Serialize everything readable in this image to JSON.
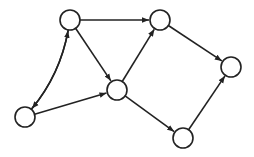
{
  "diagram": {
    "type": "directed-graph",
    "stroke_color": "#222222",
    "node_fill": "#ffffff",
    "node_radius": 10,
    "nodes": [
      {
        "id": "A",
        "x": 70,
        "y": 20
      },
      {
        "id": "B",
        "x": 25,
        "y": 117
      },
      {
        "id": "C",
        "x": 117,
        "y": 90
      },
      {
        "id": "D",
        "x": 160,
        "y": 20
      },
      {
        "id": "E",
        "x": 231,
        "y": 67
      },
      {
        "id": "F",
        "x": 183,
        "y": 138
      }
    ],
    "edges": [
      {
        "from": "B",
        "to": "A",
        "curve": "left"
      },
      {
        "from": "A",
        "to": "B",
        "curve": "right"
      },
      {
        "from": "A",
        "to": "D"
      },
      {
        "from": "A",
        "to": "C"
      },
      {
        "from": "B",
        "to": "C"
      },
      {
        "from": "C",
        "to": "D"
      },
      {
        "from": "D",
        "to": "E"
      },
      {
        "from": "C",
        "to": "F"
      },
      {
        "from": "F",
        "to": "E"
      }
    ]
  }
}
